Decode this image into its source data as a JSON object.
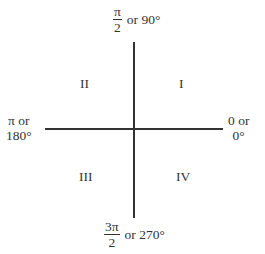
{
  "diagram": {
    "type": "unit-circle-quadrants",
    "axes": {
      "top": {
        "fraction_numerator": "π",
        "fraction_denominator": "2",
        "suffix": "or 90°"
      },
      "left": {
        "line1": "π or",
        "line2": "180°"
      },
      "right": {
        "line1": "0 or",
        "line2": "0°"
      },
      "bottom": {
        "fraction_numerator": "3π",
        "fraction_denominator": "2",
        "suffix": "or 270°"
      }
    },
    "quadrants": {
      "I": "I",
      "II": "II",
      "III": "III",
      "IV": "IV"
    },
    "colors": {
      "line": "#333333",
      "text": "#333333",
      "background": "#ffffff"
    }
  }
}
